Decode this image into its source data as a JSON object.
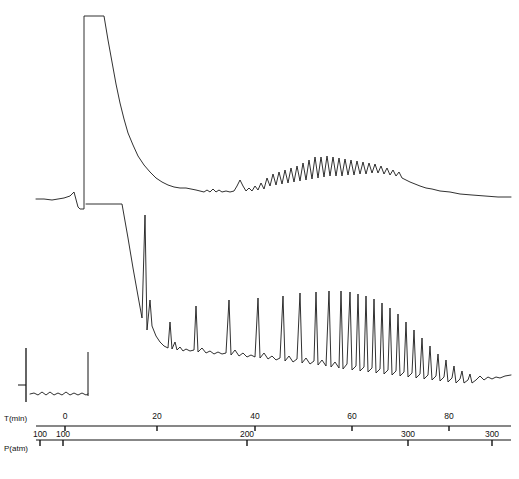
{
  "axes": {
    "time_axis_name": "T(min)",
    "pressure_axis_name": "P(atm)"
  },
  "chart_data": {
    "type": "line",
    "title": "",
    "subtitle": "",
    "xlabel": "T(min)",
    "ylabel": "",
    "grid": false,
    "legend": "none",
    "background": "#ffffff",
    "line_color": "#1a1a1a",
    "axis_color": "#111111",
    "x": {
      "label": "T(min)",
      "ticks": [
        0,
        20,
        40,
        60,
        80
      ],
      "tick_labels": [
        "0",
        "20",
        "40",
        "60",
        "80"
      ],
      "tick_x_px": [
        65,
        157,
        255,
        352,
        449
      ],
      "range_px": [
        36,
        511
      ],
      "xlim": [
        -6,
        90
      ]
    },
    "x2": {
      "label": "P(atm)",
      "tick_labels": [
        "100",
        "100",
        "200",
        "300",
        "300"
      ],
      "tick_x_px": [
        40,
        63,
        247,
        408,
        492
      ],
      "range_px": [
        36,
        511
      ],
      "note": "pressure scale ramps 100 to 300 in two segments"
    },
    "series": [
      {
        "name": "upper-trace",
        "type": "line",
        "baseline_y": 206,
        "plateau_top_y": 16,
        "plateau_x_start": 84,
        "plateau_x_end": 104,
        "decay_end_x": 196,
        "oscillation_start_x": 196,
        "oscillation_peak_x": 330,
        "oscillation_end_x": 420,
        "max_oscillation_amplitude": 26,
        "tail_end_y": 197,
        "points": [
          [
            36,
            199
          ],
          [
            44,
            199
          ],
          [
            52,
            200
          ],
          [
            58,
            199
          ],
          [
            64,
            198
          ],
          [
            70,
            196
          ],
          [
            74,
            192
          ],
          [
            78,
            207
          ],
          [
            80,
            209
          ],
          [
            84,
            209
          ],
          [
            84,
            16
          ],
          [
            104,
            16
          ],
          [
            108,
            40
          ],
          [
            112,
            62
          ],
          [
            116,
            84
          ],
          [
            120,
            103
          ],
          [
            124,
            119
          ],
          [
            128,
            133
          ],
          [
            133,
            145
          ],
          [
            138,
            156
          ],
          [
            144,
            165
          ],
          [
            150,
            172
          ],
          [
            156,
            178
          ],
          [
            162,
            182
          ],
          [
            168,
            185
          ],
          [
            174,
            187
          ],
          [
            180,
            188
          ],
          [
            186,
            188
          ],
          [
            191,
            189
          ],
          [
            196,
            190
          ],
          [
            200,
            191
          ],
          [
            204,
            192
          ],
          [
            207,
            190
          ],
          [
            210,
            192
          ],
          [
            213,
            189
          ],
          [
            216,
            192
          ],
          [
            219,
            190
          ],
          [
            222,
            192
          ],
          [
            226,
            191
          ],
          [
            230,
            192
          ],
          [
            234,
            191
          ],
          [
            237,
            186
          ],
          [
            240,
            180
          ],
          [
            243,
            186
          ],
          [
            246,
            191
          ],
          [
            249,
            188
          ],
          [
            252,
            191
          ],
          [
            255,
            186
          ],
          [
            258,
            190
          ],
          [
            261,
            183
          ],
          [
            264,
            189
          ],
          [
            267,
            178
          ],
          [
            270,
            186
          ],
          [
            273,
            174
          ],
          [
            276,
            185
          ],
          [
            279,
            172
          ],
          [
            282,
            184
          ],
          [
            285,
            170
          ],
          [
            288,
            183
          ],
          [
            291,
            168
          ],
          [
            294,
            182
          ],
          [
            297,
            166
          ],
          [
            300,
            181
          ],
          [
            303,
            163
          ],
          [
            306,
            180
          ],
          [
            309,
            160
          ],
          [
            312,
            179
          ],
          [
            315,
            157
          ],
          [
            318,
            178
          ],
          [
            321,
            157
          ],
          [
            324,
            177
          ],
          [
            327,
            156
          ],
          [
            330,
            176
          ],
          [
            333,
            157
          ],
          [
            336,
            176
          ],
          [
            339,
            158
          ],
          [
            342,
            176
          ],
          [
            345,
            159
          ],
          [
            348,
            175
          ],
          [
            351,
            160
          ],
          [
            354,
            175
          ],
          [
            357,
            161
          ],
          [
            360,
            174
          ],
          [
            363,
            162
          ],
          [
            366,
            174
          ],
          [
            369,
            163
          ],
          [
            372,
            173
          ],
          [
            375,
            164
          ],
          [
            378,
            173
          ],
          [
            381,
            166
          ],
          [
            384,
            174
          ],
          [
            387,
            168
          ],
          [
            390,
            175
          ],
          [
            393,
            170
          ],
          [
            396,
            176
          ],
          [
            399,
            172
          ],
          [
            402,
            178
          ],
          [
            406,
            180
          ],
          [
            410,
            182
          ],
          [
            415,
            184
          ],
          [
            420,
            186
          ],
          [
            426,
            188
          ],
          [
            432,
            189
          ],
          [
            440,
            191
          ],
          [
            450,
            192
          ],
          [
            460,
            194
          ],
          [
            472,
            195
          ],
          [
            485,
            196
          ],
          [
            498,
            197
          ],
          [
            511,
            197
          ]
        ]
      },
      {
        "name": "lower-trace",
        "type": "line",
        "baseline_y": 388,
        "plateau_top_y": 204,
        "plateau_x_start": 86,
        "plateau_x_end": 122,
        "spike_x": 145,
        "spike_top_y": 215,
        "spike_count": 30,
        "oscillation_start_x": 170,
        "damping_start_x": 400,
        "tail_end_y": 375,
        "points": [
          [
            86,
            204
          ],
          [
            122,
            204
          ],
          [
            128,
            238
          ],
          [
            133,
            268
          ],
          [
            138,
            296
          ],
          [
            142,
            318
          ],
          [
            145,
            215
          ],
          [
            147,
            330
          ],
          [
            150,
            300
          ],
          [
            152,
            326
          ],
          [
            156,
            336
          ],
          [
            160,
            342
          ],
          [
            164,
            346
          ],
          [
            168,
            348
          ],
          [
            170,
            322
          ],
          [
            172,
            349
          ],
          [
            175,
            342
          ],
          [
            177,
            350
          ],
          [
            180,
            347
          ],
          [
            183,
            351
          ],
          [
            186,
            349
          ],
          [
            190,
            351
          ],
          [
            194,
            350
          ],
          [
            196,
            306
          ],
          [
            198,
            352
          ],
          [
            202,
            348
          ],
          [
            206,
            353
          ],
          [
            210,
            351
          ],
          [
            214,
            354
          ],
          [
            218,
            352
          ],
          [
            222,
            354
          ],
          [
            226,
            353
          ],
          [
            229,
            300
          ],
          [
            231,
            355
          ],
          [
            235,
            350
          ],
          [
            239,
            356
          ],
          [
            243,
            353
          ],
          [
            247,
            357
          ],
          [
            251,
            355
          ],
          [
            255,
            357
          ],
          [
            258,
            298
          ],
          [
            260,
            358
          ],
          [
            264,
            353
          ],
          [
            268,
            359
          ],
          [
            272,
            356
          ],
          [
            276,
            360
          ],
          [
            280,
            358
          ],
          [
            283,
            296
          ],
          [
            285,
            361
          ],
          [
            289,
            356
          ],
          [
            293,
            362
          ],
          [
            297,
            359
          ],
          [
            300,
            293
          ],
          [
            302,
            363
          ],
          [
            306,
            358
          ],
          [
            310,
            364
          ],
          [
            314,
            361
          ],
          [
            316,
            292
          ],
          [
            318,
            365
          ],
          [
            322,
            360
          ],
          [
            326,
            366
          ],
          [
            329,
            291
          ],
          [
            331,
            367
          ],
          [
            335,
            362
          ],
          [
            339,
            368
          ],
          [
            341,
            291
          ],
          [
            343,
            369
          ],
          [
            347,
            364
          ],
          [
            350,
            292
          ],
          [
            352,
            370
          ],
          [
            356,
            366
          ],
          [
            358,
            294
          ],
          [
            360,
            371
          ],
          [
            364,
            367
          ],
          [
            366,
            296
          ],
          [
            368,
            372
          ],
          [
            372,
            368
          ],
          [
            374,
            299
          ],
          [
            376,
            373
          ],
          [
            380,
            369
          ],
          [
            382,
            303
          ],
          [
            384,
            374
          ],
          [
            388,
            370
          ],
          [
            390,
            308
          ],
          [
            392,
            375
          ],
          [
            396,
            371
          ],
          [
            398,
            314
          ],
          [
            400,
            376
          ],
          [
            404,
            372
          ],
          [
            406,
            322
          ],
          [
            408,
            377
          ],
          [
            412,
            373
          ],
          [
            414,
            330
          ],
          [
            416,
            378
          ],
          [
            420,
            374
          ],
          [
            422,
            338
          ],
          [
            424,
            379
          ],
          [
            428,
            375
          ],
          [
            430,
            346
          ],
          [
            432,
            380
          ],
          [
            436,
            376
          ],
          [
            438,
            354
          ],
          [
            440,
            381
          ],
          [
            444,
            377
          ],
          [
            446,
            360
          ],
          [
            448,
            382
          ],
          [
            452,
            378
          ],
          [
            454,
            366
          ],
          [
            456,
            383
          ],
          [
            460,
            379
          ],
          [
            462,
            371
          ],
          [
            464,
            383
          ],
          [
            468,
            380
          ],
          [
            470,
            374
          ],
          [
            472,
            383
          ],
          [
            476,
            380
          ],
          [
            480,
            376
          ],
          [
            484,
            380
          ],
          [
            488,
            377
          ],
          [
            492,
            379
          ],
          [
            496,
            377
          ],
          [
            500,
            378
          ],
          [
            505,
            376
          ],
          [
            511,
            375
          ]
        ]
      },
      {
        "name": "inset-baseline-trace",
        "type": "line",
        "points": [
          [
            30,
            394
          ],
          [
            34,
            393
          ],
          [
            38,
            395
          ],
          [
            42,
            392
          ],
          [
            46,
            395
          ],
          [
            50,
            392
          ],
          [
            54,
            395
          ],
          [
            58,
            393
          ],
          [
            62,
            395
          ],
          [
            66,
            392
          ],
          [
            70,
            395
          ],
          [
            74,
            393
          ],
          [
            78,
            395
          ],
          [
            82,
            393
          ],
          [
            86,
            395
          ],
          [
            88,
            394
          ]
        ],
        "vertical_axis_x": 26,
        "vertical_axis_y_top": 348,
        "vertical_axis_y_bottom": 402,
        "right_rule_x": 88,
        "right_rule_y_top": 352,
        "right_rule_y_bottom": 396
      }
    ]
  }
}
